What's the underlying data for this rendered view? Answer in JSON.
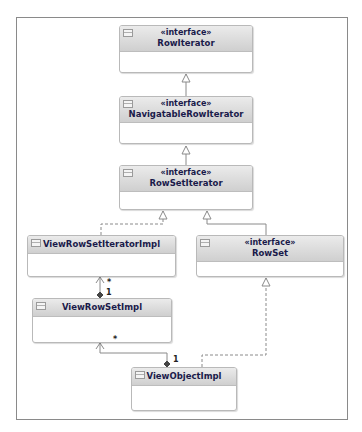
{
  "diagram": {
    "type": "UML class diagram",
    "classes": [
      {
        "id": "rowiterator",
        "stereotype": "«interface»",
        "name": "RowIterator"
      },
      {
        "id": "navigatable",
        "stereotype": "«interface»",
        "name": "NavigatableRowIterator"
      },
      {
        "id": "rowsetiterator",
        "stereotype": "«interface»",
        "name": "RowSetIterator"
      },
      {
        "id": "viewrowsetiteratorimpl",
        "stereotype": "",
        "name": "ViewRowSetIteratorImpl"
      },
      {
        "id": "rowset",
        "stereotype": "«interface»",
        "name": "RowSet"
      },
      {
        "id": "viewrowsetimpl",
        "stereotype": "",
        "name": "ViewRowSetImpl"
      },
      {
        "id": "viewobjectimpl",
        "stereotype": "",
        "name": "ViewObjectImpl"
      }
    ],
    "relations": [
      {
        "from": "NavigatableRowIterator",
        "to": "RowIterator",
        "kind": "generalization"
      },
      {
        "from": "RowSetIterator",
        "to": "NavigatableRowIterator",
        "kind": "generalization"
      },
      {
        "from": "ViewRowSetIteratorImpl",
        "to": "RowSetIterator",
        "kind": "realization"
      },
      {
        "from": "RowSet",
        "to": "RowSetIterator",
        "kind": "generalization"
      },
      {
        "from": "ViewRowSetImpl",
        "to": "ViewRowSetIteratorImpl",
        "kind": "composition",
        "source_mult": "1",
        "target_mult": "*"
      },
      {
        "from": "ViewObjectImpl",
        "to": "ViewRowSetImpl",
        "kind": "composition",
        "source_mult": "1",
        "target_mult": "*"
      },
      {
        "from": "ViewObjectImpl",
        "to": "RowSet",
        "kind": "realization"
      }
    ],
    "multiplicities": {
      "vrsi_star": "*",
      "vrs_one": "1",
      "vrs_star": "*",
      "voi_one": "1"
    },
    "colors": {
      "header_top": "#ebebeb",
      "header_bottom": "#cfcfcf",
      "border": "#b9b9b9",
      "text": "#1a1a4a",
      "line": "#8a8a8a"
    }
  }
}
